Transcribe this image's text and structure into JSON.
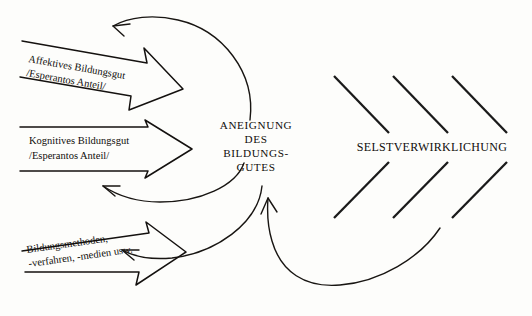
{
  "diagram": {
    "language": "de",
    "background_color": "#fdfdfb",
    "ink_color": "#14110f"
  },
  "center_node": {
    "name": "aneignung-des-bildungsgutes",
    "lines": [
      "ANEIGNUNG",
      "DES",
      "BILDUNGS-",
      "GUTES"
    ]
  },
  "right_node": {
    "name": "selstverwirklichung",
    "label": "SELSTVERWIRKLICHUNG"
  },
  "input_arrows": [
    {
      "id": "affektives",
      "lines": [
        "Affektives Bildungsgut",
        "/Esperantos Anteil/"
      ],
      "rotation_deg": 10
    },
    {
      "id": "kognitives",
      "lines": [
        "Kognitives Bildungsgut",
        "/Esperantos Anteil/"
      ],
      "rotation_deg": 0
    },
    {
      "id": "bildungsmethoden",
      "lines": [
        "Bildungsmethoden,",
        "-verfahren, -medien usw."
      ],
      "rotation_deg": -8
    }
  ],
  "feedback_curves": [
    {
      "id": "top-feedback-curve",
      "direction": "center-to-upper-left"
    },
    {
      "id": "middle-feedback-curve",
      "direction": "center-to-middle-left"
    },
    {
      "id": "bottom-feedback-curve",
      "direction": "center-to-lower-left"
    },
    {
      "id": "return-curve-to-center",
      "direction": "right-to-center-up"
    }
  ],
  "chevrons": {
    "name": "selstverwirklichung-chevrons",
    "count": 6,
    "rows": 2
  }
}
